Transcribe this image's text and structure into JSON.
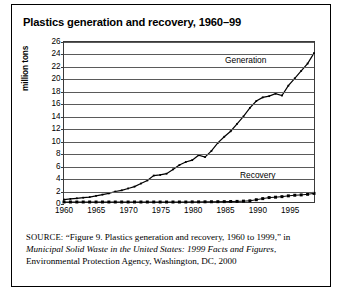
{
  "figure": {
    "title": "Plastics generation and recovery, 1960–99"
  },
  "source_note": {
    "label": "SOURCE:",
    "quoted_title": "“Figure 9. Plastics generation and recovery, 1960 to 1999,”",
    "connector": "in",
    "publication": "Municipal Solid Waste in the United States: 1999 Facts and Figures",
    "publisher": ", Environmental Protection Agency, Washington, DC, 2000"
  },
  "annotations": {
    "generation": "Generation",
    "recovery": "Recovery"
  },
  "chart_data": {
    "type": "line",
    "title": "Plastics generation and recovery, 1960–99",
    "xlabel": "",
    "ylabel": "million tons",
    "ylim": [
      0,
      26
    ],
    "ytick_step": 2,
    "yticks": [
      0,
      2,
      4,
      6,
      8,
      10,
      12,
      14,
      16,
      18,
      20,
      22,
      24,
      26
    ],
    "xlim": [
      1960,
      1999
    ],
    "xticks": [
      1960,
      1965,
      1970,
      1975,
      1980,
      1985,
      1990,
      1995
    ],
    "xtick_labels": [
      "1960",
      "1965",
      "1970",
      "1975",
      "1980",
      "1985",
      "1990",
      "1995"
    ],
    "grid": "horizontal",
    "legend": "inline-annotations",
    "x": [
      1960,
      1961,
      1962,
      1963,
      1964,
      1965,
      1966,
      1967,
      1968,
      1969,
      1970,
      1971,
      1972,
      1973,
      1974,
      1975,
      1976,
      1977,
      1978,
      1979,
      1980,
      1981,
      1982,
      1983,
      1984,
      1985,
      1986,
      1987,
      1988,
      1989,
      1990,
      1991,
      1992,
      1993,
      1994,
      1995,
      1996,
      1997,
      1998,
      1999
    ],
    "series": [
      {
        "name": "Generation",
        "marker": "small-dot",
        "values": [
          0.4,
          0.5,
          0.6,
          0.7,
          0.8,
          1.0,
          1.2,
          1.4,
          1.7,
          1.9,
          2.2,
          2.5,
          3.0,
          3.5,
          4.3,
          4.4,
          4.6,
          5.3,
          6.0,
          6.5,
          6.8,
          7.6,
          7.3,
          8.3,
          9.6,
          10.6,
          11.5,
          12.7,
          13.9,
          15.3,
          16.4,
          17.0,
          17.2,
          17.6,
          17.3,
          18.9,
          20.1,
          21.3,
          22.5,
          24.2
        ]
      },
      {
        "name": "Recovery",
        "marker": "square",
        "values": [
          0.0,
          0.0,
          0.0,
          0.0,
          0.0,
          0.0,
          0.0,
          0.0,
          0.0,
          0.0,
          0.0,
          0.0,
          0.0,
          0.0,
          0.0,
          0.0,
          0.0,
          0.0,
          0.0,
          0.0,
          0.02,
          0.02,
          0.03,
          0.04,
          0.05,
          0.06,
          0.08,
          0.1,
          0.14,
          0.19,
          0.37,
          0.55,
          0.72,
          0.78,
          0.87,
          1.0,
          1.1,
          1.15,
          1.25,
          1.4
        ]
      }
    ]
  }
}
